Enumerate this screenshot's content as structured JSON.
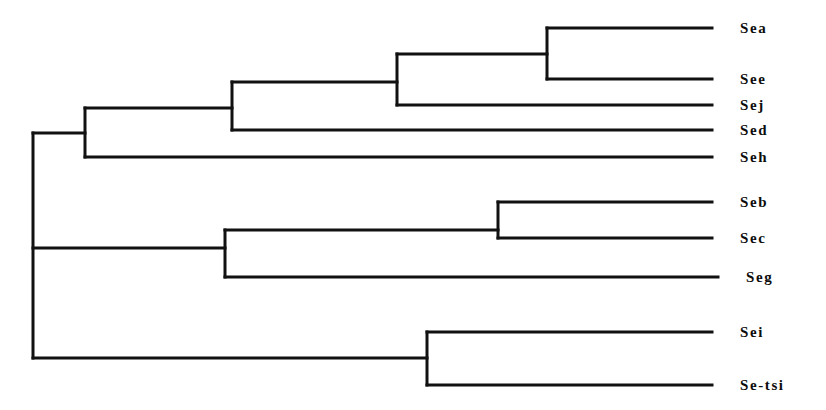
{
  "figure": {
    "type": "dendrogram",
    "width": 826,
    "height": 410,
    "background_color": "#ffffff",
    "line_color": "#111111",
    "line_width": 3
  },
  "chart_data": {
    "type": "diagram",
    "subtype": "dendrogram",
    "orientation": "horizontal-left-to-right",
    "title": "",
    "xlabel": "",
    "ylabel": "",
    "grid": false,
    "legend": null,
    "axis_shown": false,
    "leaf_count": 10,
    "leaves": [
      {
        "id": "Sea",
        "label": "Sea",
        "y": 28,
        "branch_start_x": 547,
        "branch_end_x": 712,
        "label_x": 740
      },
      {
        "id": "See",
        "label": "See",
        "y": 79,
        "branch_start_x": 547,
        "branch_end_x": 712,
        "label_x": 740
      },
      {
        "id": "Sej",
        "label": "Sej",
        "y": 105,
        "branch_start_x": 397,
        "branch_end_x": 712,
        "label_x": 740
      },
      {
        "id": "Sed",
        "label": "Sed",
        "y": 130,
        "branch_start_x": 232,
        "branch_end_x": 712,
        "label_x": 740
      },
      {
        "id": "Seh",
        "label": "Seh",
        "y": 157,
        "branch_start_x": 85,
        "branch_end_x": 712,
        "label_x": 740
      },
      {
        "id": "Seb",
        "label": "Seb",
        "y": 202,
        "branch_start_x": 498,
        "branch_end_x": 712,
        "label_x": 740
      },
      {
        "id": "Sec",
        "label": "Sec",
        "y": 238,
        "branch_start_x": 498,
        "branch_end_x": 712,
        "label_x": 740
      },
      {
        "id": "Seg",
        "label": "Seg",
        "y": 277,
        "branch_start_x": 225,
        "branch_end_x": 718,
        "label_x": 746
      },
      {
        "id": "Sei",
        "label": "Sei",
        "y": 332,
        "branch_start_x": 427,
        "branch_end_x": 712,
        "label_x": 740
      },
      {
        "id": "Se-tsi",
        "label": "Se-tsi",
        "y": 385,
        "branch_start_x": 427,
        "branch_end_x": 712,
        "label_x": 740
      }
    ],
    "nodes": [
      {
        "id": "root",
        "x": 33,
        "y_top": 133,
        "y_bottom": 358,
        "children": [
          "clade-upper",
          "clade-middle",
          "clade-lower"
        ]
      },
      {
        "id": "clade-upper",
        "x": 85,
        "y_top": 108,
        "y_bottom": 157,
        "parent_branch_y": 133,
        "parent_x": 33,
        "children": [
          "clade-upper-inner",
          "Seh"
        ]
      },
      {
        "id": "clade-upper-inner",
        "x": 232,
        "y_top": 82,
        "y_bottom": 130,
        "parent_branch_y": 108,
        "parent_x": 85,
        "children": [
          "clade-sea-see-sej",
          "Sed"
        ]
      },
      {
        "id": "clade-sea-see-sej",
        "x": 397,
        "y_top": 54,
        "y_bottom": 105,
        "parent_branch_y": 82,
        "parent_x": 232,
        "children": [
          "clade-sea-see",
          "Sej"
        ]
      },
      {
        "id": "clade-sea-see",
        "x": 547,
        "y_top": 28,
        "y_bottom": 79,
        "parent_branch_y": 54,
        "parent_x": 397,
        "children": [
          "Sea",
          "See"
        ]
      },
      {
        "id": "clade-middle",
        "x": 225,
        "y_top": 230,
        "y_bottom": 277,
        "parent_branch_y": 248,
        "parent_x": 33,
        "children": [
          "clade-seb-sec",
          "Seg"
        ]
      },
      {
        "id": "clade-seb-sec",
        "x": 498,
        "y_top": 202,
        "y_bottom": 238,
        "parent_branch_y": 230,
        "parent_x": 225,
        "children": [
          "Seb",
          "Sec"
        ]
      },
      {
        "id": "clade-lower",
        "x": 427,
        "y_top": 332,
        "y_bottom": 385,
        "parent_branch_y": 358,
        "parent_x": 33,
        "children": [
          "Sei",
          "Se-tsi"
        ]
      }
    ],
    "connector_segments": [
      {
        "from": "root",
        "to": "clade-upper",
        "y": 133,
        "x1": 33,
        "x2": 85
      },
      {
        "from": "root",
        "to": "clade-middle",
        "y": 248,
        "x1": 33,
        "x2": 225
      },
      {
        "from": "root",
        "to": "clade-lower",
        "y": 358,
        "x1": 33,
        "x2": 427
      },
      {
        "from": "clade-upper",
        "to": "clade-upper-inner",
        "y": 108,
        "x1": 85,
        "x2": 232
      },
      {
        "from": "clade-upper-inner",
        "to": "clade-sea-see-sej",
        "y": 82,
        "x1": 232,
        "x2": 397
      },
      {
        "from": "clade-sea-see-sej",
        "to": "clade-sea-see",
        "y": 54,
        "x1": 397,
        "x2": 547
      },
      {
        "from": "clade-middle",
        "to": "clade-seb-sec",
        "y": 230,
        "x1": 225,
        "x2": 498
      }
    ]
  }
}
